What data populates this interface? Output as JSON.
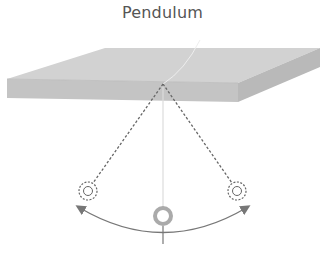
{
  "diagram": {
    "title": "Pendulum",
    "elements": [
      {
        "id": "ceiling-slab",
        "type": "3d-slab",
        "color": "#c9c9c9"
      },
      {
        "id": "string-rest",
        "type": "line",
        "style": "solid",
        "color": "#dddddd"
      },
      {
        "id": "string-left",
        "type": "line",
        "style": "dashed",
        "color": "#666666"
      },
      {
        "id": "string-right",
        "type": "line",
        "style": "dashed",
        "color": "#666666"
      },
      {
        "id": "bob-left",
        "type": "ring",
        "style": "dashed"
      },
      {
        "id": "bob-center",
        "type": "ring",
        "style": "solid",
        "color": "#aaaaaa"
      },
      {
        "id": "bob-right",
        "type": "ring",
        "style": "dashed"
      },
      {
        "id": "swing-arc",
        "type": "double-arrow-arc",
        "color": "#777777"
      },
      {
        "id": "center-tick",
        "type": "tick"
      }
    ],
    "colors": {
      "slab_top": "#d0d0d0",
      "slab_front": "#c2c2c2",
      "slab_side": "#b8b8b8",
      "line": "#666666",
      "arc": "#777777",
      "bob_center": "#aaaaaa"
    }
  }
}
